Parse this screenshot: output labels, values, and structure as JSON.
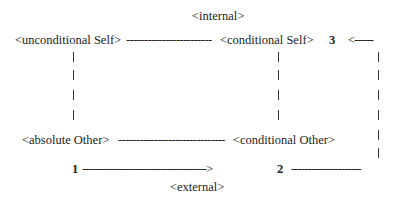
{
  "diagram": {
    "top_label": "<internal>",
    "bottom_label": "<external>",
    "row_top": {
      "left_node": "<unconditional Self>",
      "connector": "------------------------",
      "right_node": "<conditional Self>",
      "marker": "3",
      "arrow_in": "<------"
    },
    "row_bottom": {
      "left_node": "<absolute Other>",
      "connector": "------------------------------",
      "right_node": "<conditional Other>"
    },
    "row_path": {
      "start_marker": "1",
      "connector": "-------------------------------------->",
      "end_marker": "2",
      "connector_out": "---------------------"
    }
  }
}
